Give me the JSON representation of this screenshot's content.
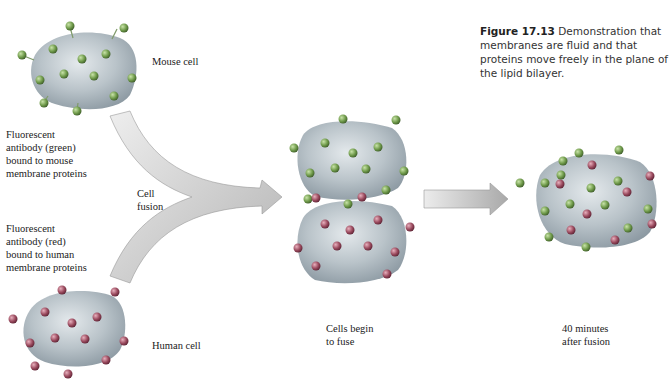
{
  "caption": {
    "figure_number": "Figure 17.13",
    "text": " Demonstration that membranes are fluid and that proteins move freely in the plane of the lipid bilayer."
  },
  "labels": {
    "mouse_cell": "Mouse cell",
    "human_cell": "Human cell",
    "green_antibody": "Fluorescent\nantibody (green)\nbound to mouse\nmembrane proteins",
    "red_antibody": "Fluorescent\nantibody (red)\nbound to human\nmembrane proteins",
    "cell_fusion": "Cell\nfusion",
    "cells_begin": "Cells begin\nto fuse",
    "after_fusion": "40 minutes\nafter fusion"
  },
  "colors": {
    "cell_fill": "#b9c3c9",
    "cell_shadow": "#8d9aa3",
    "mouse_antibody": "#6f9a4a",
    "human_antibody": "#9a4a5e",
    "arrow_light": "#e6e6e6",
    "arrow_dark": "#a9a9a9"
  }
}
